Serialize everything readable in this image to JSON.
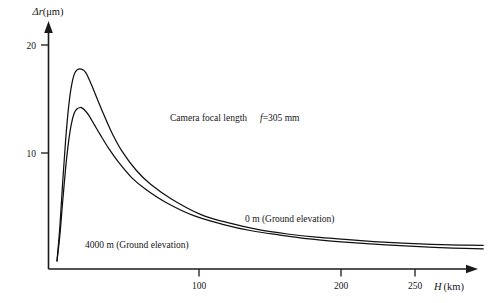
{
  "chart_data": {
    "type": "line",
    "title": "",
    "xlabel": "H (km)",
    "ylabel": "Δr(μm)",
    "xlim": [
      0,
      296
    ],
    "ylim": [
      0,
      22
    ],
    "grid": false,
    "legend_position": "inline-annotations",
    "x_ticks": [
      100,
      200,
      250
    ],
    "x_tick_labels": [
      "100",
      "200",
      "250"
    ],
    "y_ticks": [
      10,
      20
    ],
    "y_tick_labels": [
      "10",
      "20"
    ],
    "annotations": [
      "Camera focal length   f=305 mm",
      "0 m (Ground elevation)",
      "4000 m (Ground elevation)"
    ],
    "series": [
      {
        "name": "0 m (Ground elevation)",
        "x": [
          0,
          2,
          4,
          6,
          8,
          10,
          12,
          14,
          16,
          18,
          19,
          21,
          24,
          28,
          32,
          38,
          45,
          55,
          65,
          80,
          100,
          120,
          140,
          160,
          180,
          200,
          220,
          240,
          260,
          280,
          296
        ],
        "values": [
          0,
          3.2,
          7.4,
          11.2,
          14.2,
          16.2,
          17.3,
          17.7,
          17.8,
          17.7,
          17.6,
          17.2,
          16.3,
          15.0,
          13.7,
          11.9,
          10.2,
          8.4,
          7.1,
          5.7,
          4.3,
          3.5,
          2.9,
          2.5,
          2.2,
          2.0,
          1.8,
          1.65,
          1.55,
          1.48,
          1.45
        ]
      },
      {
        "name": "4000 m (Ground elevation)",
        "x": [
          0,
          2,
          4,
          6,
          8,
          10,
          12,
          14,
          16,
          17,
          19,
          22,
          26,
          30,
          36,
          43,
          52,
          62,
          76,
          95,
          115,
          135,
          155,
          175,
          195,
          215,
          235,
          255,
          275,
          296
        ],
        "values": [
          0,
          2.4,
          5.6,
          8.6,
          11.0,
          12.7,
          13.7,
          14.1,
          14.2,
          14.2,
          14.0,
          13.5,
          12.6,
          11.7,
          10.4,
          9.1,
          7.7,
          6.6,
          5.4,
          4.2,
          3.4,
          2.8,
          2.4,
          2.05,
          1.8,
          1.6,
          1.45,
          1.3,
          1.2,
          1.12
        ]
      }
    ]
  },
  "axes": {
    "y_axis_caption": "Δr(μm)",
    "y_symbol": "Δr",
    "y_unit": "(μm)",
    "x_symbol": "H",
    "x_unit": "(km)",
    "tick_20": "20",
    "tick_10": "10",
    "tick_100": "100",
    "tick_200": "200",
    "tick_250": "250"
  },
  "annotations": {
    "focal_prefix": "Camera focal length",
    "focal_symbol": "f",
    "focal_value": "=305 mm",
    "curve_upper_label": "0 m (Ground elevation)",
    "curve_lower_label": "4000 m (Ground elevation)"
  },
  "colors": {
    "ink": "#161616",
    "curve": "#111111",
    "background": "#ffffff"
  }
}
